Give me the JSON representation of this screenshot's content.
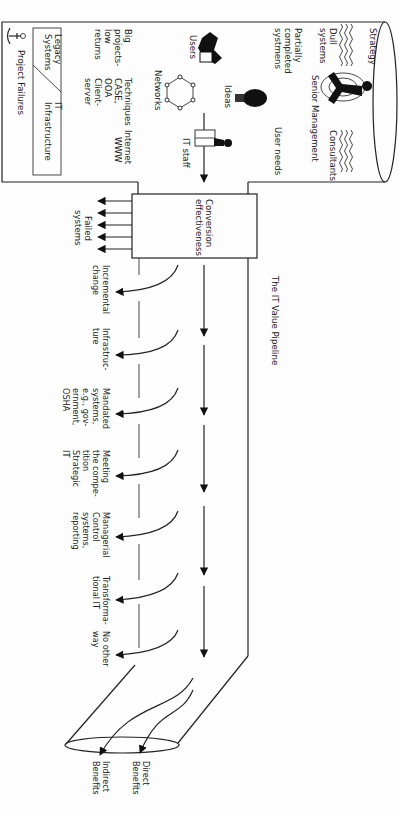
{
  "title": "The IT Value Pipeline",
  "reservoir": {
    "strategy": "Strategy",
    "dull_systems": [
      "Dull",
      "systems"
    ],
    "partially": [
      "Partially",
      "completed",
      "systmens"
    ],
    "senior_management": "Senior Management",
    "consultants": "Consultants",
    "user_needs": "User needs",
    "users": "Users",
    "ideas": "Ideas",
    "it_staff": "IT staff",
    "networks": "Networks",
    "big_projects": [
      "Big",
      "projects-",
      "low",
      "returns"
    ],
    "techniques": [
      "Techniques",
      "CASE,",
      "OOA",
      "Client-",
      "server"
    ],
    "internet": [
      "Internet",
      "WWW"
    ],
    "legacy_systems": [
      "Legacy",
      "Systems"
    ],
    "it_infrastructure": [
      "IT",
      "Infrastructure"
    ],
    "project_failures": "Project Failures"
  },
  "conversion": {
    "label": [
      "Conversion",
      "effectiveness"
    ],
    "failed": [
      "Failed",
      "systems"
    ]
  },
  "outlets": [
    {
      "lines": [
        "Incremental",
        "change"
      ]
    },
    {
      "lines": [
        "Infrastruc-",
        "ture"
      ]
    },
    {
      "lines": [
        "Mandated",
        "systems,",
        "e.g., gov-",
        "ernment,",
        "OSHA"
      ]
    },
    {
      "lines": [
        "Meeting",
        "the compe-",
        "tition",
        "Strategic",
        "IT"
      ]
    },
    {
      "lines": [
        "Managerial",
        "Control",
        "systems,",
        "reporting"
      ]
    },
    {
      "lines": [
        "Transforma-",
        "tional IT"
      ]
    },
    {
      "lines": [
        "No other",
        "way"
      ]
    }
  ],
  "benefits": {
    "direct": [
      "Direct",
      "Benefits"
    ],
    "indirect": [
      "Indirect",
      "Benefits"
    ]
  }
}
